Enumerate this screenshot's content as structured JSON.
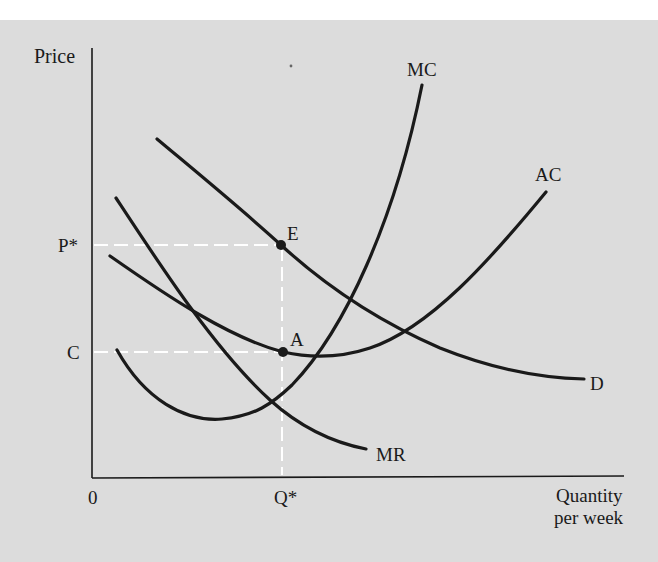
{
  "diagram": {
    "type": "economics-monopolistic-competition",
    "colors": {
      "background": "#dcdcdc",
      "top_band": "#ffffff",
      "curve": "#1a1a1a",
      "guide_dashes": "#ffffff"
    },
    "axes": {
      "y_label": "Price",
      "x_label_line1": "Quantity",
      "x_label_line2": "per week",
      "origin_label": "0"
    },
    "tick_labels": {
      "p_star": "P*",
      "c": "C",
      "q_star": "Q*"
    },
    "curves": {
      "mc": "MC",
      "ac": "AC",
      "d": "D",
      "mr": "MR"
    },
    "points": {
      "e": "E",
      "a": "A"
    }
  }
}
